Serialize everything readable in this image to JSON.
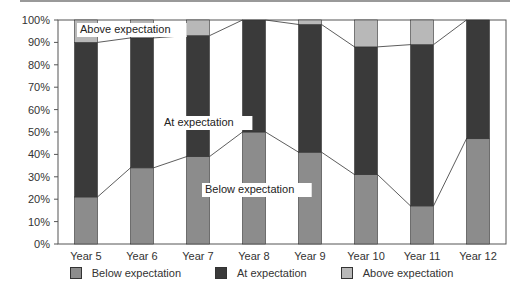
{
  "chart_data": {
    "type": "bar",
    "stacked": true,
    "title": "",
    "xlabel": "",
    "ylabel": "",
    "ylim": [
      0,
      100
    ],
    "yticks": [
      "0%",
      "10%",
      "20%",
      "30%",
      "40%",
      "50%",
      "60%",
      "70%",
      "80%",
      "90%",
      "100%"
    ],
    "categories": [
      "Year 5",
      "Year 6",
      "Year 7",
      "Year 8",
      "Year 9",
      "Year 10",
      "Year 11",
      "Year 12"
    ],
    "series": [
      {
        "name": "Below expectation",
        "color": "#8c8c8c",
        "values": [
          21,
          34,
          39,
          50,
          41,
          31,
          17,
          47
        ]
      },
      {
        "name": "At expectation",
        "color": "#3a3a3a",
        "values": [
          69,
          58,
          54,
          50,
          57,
          57,
          72,
          53
        ]
      },
      {
        "name": "Above expectation",
        "color": "#b8b8b8",
        "values": [
          10,
          8,
          7,
          0,
          2,
          12,
          11,
          0
        ]
      }
    ],
    "annotations": [
      {
        "text": "Above expectation",
        "x": "Year 5",
        "y": 96
      },
      {
        "text": "At expectation",
        "x": "Year 7",
        "y": 55
      },
      {
        "text": "Below expectation",
        "x": "Year 8",
        "y": 25
      }
    ],
    "series_lines": true,
    "grid": false,
    "legend_position": "bottom"
  },
  "legend": {
    "items": [
      {
        "label": "Below expectation",
        "color": "#8c8c8c"
      },
      {
        "label": "At expectation",
        "color": "#3a3a3a"
      },
      {
        "label": "Above expectation",
        "color": "#b8b8b8"
      }
    ]
  }
}
